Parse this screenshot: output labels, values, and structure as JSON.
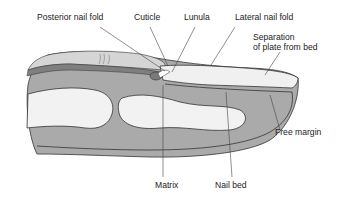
{
  "diagram": {
    "labels": {
      "posterior_nail_fold": "Posterior nail fold",
      "cuticle": "Cuticle",
      "lunula": "Lunula",
      "lateral_nail_fold": "Lateral nail fold",
      "separation_line1": "Separation",
      "separation_line2": "of plate from bed",
      "free_margin": "Free margin",
      "matrix": "Matrix",
      "nail_bed": "Nail bed"
    },
    "colors": {
      "soft_tissue": "#a9a9a9",
      "dermis_band": "#8c8c8c",
      "bone": "#f2f2f2",
      "nail_plate": "#efefef",
      "outline": "#333333",
      "matrix": "#7a7a7a",
      "leader": "#444444",
      "text": "#222222"
    }
  }
}
